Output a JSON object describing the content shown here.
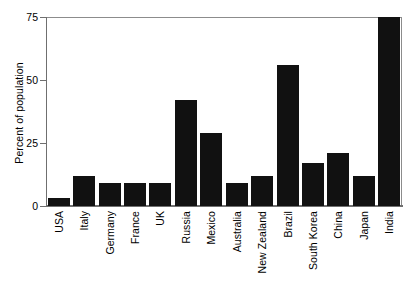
{
  "chart_data": {
    "type": "bar",
    "title": "",
    "subtitle": "",
    "xlabel": "",
    "ylabel": "Percent of population",
    "ylim": [
      0,
      75
    ],
    "yticks": [
      0,
      25,
      50,
      75
    ],
    "ytick_labels": [
      "0",
      "25",
      "50",
      "75"
    ],
    "grid": false,
    "legend": null,
    "bar_color": "#111111",
    "axis_color": "#6f6f6f",
    "categories": [
      "USA",
      "Italy",
      "Germany",
      "France",
      "UK",
      "Russia",
      "Mexico",
      "Australia",
      "New Zealand",
      "Brazil",
      "South Korea",
      "China",
      "Japan",
      "India"
    ],
    "values": [
      3,
      12,
      9,
      9,
      9,
      42,
      29,
      9,
      12,
      56,
      17,
      21,
      12,
      75
    ],
    "series": [
      {
        "name": "Percent of population",
        "values": [
          3,
          12,
          9,
          9,
          9,
          42,
          29,
          9,
          12,
          56,
          17,
          21,
          12,
          75
        ]
      }
    ]
  }
}
